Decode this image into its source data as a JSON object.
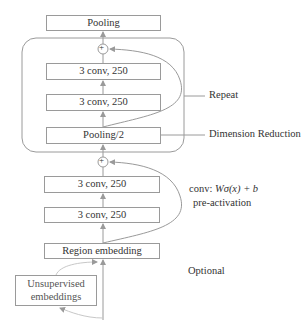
{
  "diagram": {
    "type": "network-architecture",
    "nodes": {
      "pooling_top": "Pooling",
      "conv_repeat_1": "3 conv, 250",
      "conv_repeat_2": "3 conv, 250",
      "pooling_half": "Pooling/2",
      "conv_base_1": "3 conv, 250",
      "conv_base_2": "3 conv, 250",
      "region_embedding": "Region embedding",
      "unsupervised_embeddings_line1": "Unsupervised",
      "unsupervised_embeddings_line2": "embeddings"
    },
    "annotations": {
      "repeat": "Repeat",
      "dimension_reduction": "Dimension Reduction",
      "conv_formula_prefix": "conv: ",
      "conv_formula": "Wσ(x) + b",
      "pre_activation": "pre-activation",
      "optional": "Optional"
    },
    "symbols": {
      "add": "+"
    },
    "colors": {
      "line": "#9a9a9a",
      "text": "#333333"
    }
  }
}
